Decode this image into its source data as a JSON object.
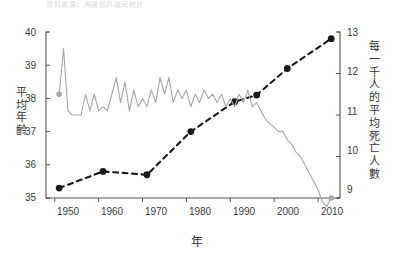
{
  "figure": {
    "caption_faint": "資料來源：內政部戶政司統計",
    "background": "#ffffff"
  },
  "axes": {
    "x": {
      "label": "年",
      "ticks": [
        "1950",
        "1960",
        "1970",
        "1980",
        "1990",
        "2000",
        "2010"
      ],
      "range": [
        1948,
        2015
      ]
    },
    "y_left": {
      "label_chars": [
        "平",
        "均",
        "年",
        "齡"
      ],
      "label": "平均年齡",
      "ticks": [
        "35",
        "36",
        "37",
        "38",
        "39",
        "40"
      ],
      "range": [
        35,
        40
      ],
      "color": "#222222"
    },
    "y_right": {
      "label_chars": [
        "每",
        "一",
        "千",
        "人",
        "的",
        "平",
        "均",
        "死",
        "亡",
        "人",
        "數"
      ],
      "label": "每一千人的平均死亡人數",
      "ticks": [
        "9",
        "10",
        "11",
        "12",
        "13"
      ],
      "range": [
        9,
        13
      ],
      "color": "#9a9a9a"
    }
  },
  "chart_data": {
    "type": "line",
    "title": "",
    "subtitle": "",
    "xlabel": "年",
    "ylabel": "平均年齡",
    "ylabel_secondary": "每一千人的平均死亡人數",
    "xlim": [
      1948,
      2015
    ],
    "ylim": [
      35,
      40
    ],
    "ylim_secondary": [
      9,
      13
    ],
    "grid": false,
    "legend": "none",
    "series": [
      {
        "name": "平均年齡",
        "axis": "left",
        "style": "dashed",
        "marker": "circle",
        "color": "#1a1a1a",
        "x": [
          1951,
          1961,
          1971,
          1981,
          1991,
          1996,
          2003,
          2013
        ],
        "values": [
          35.3,
          35.8,
          35.7,
          37.0,
          37.9,
          38.1,
          38.9,
          39.8
        ]
      },
      {
        "name": "每一千人的平均死亡人數",
        "axis": "right",
        "style": "solid",
        "marker": "endpoints",
        "color": "#a6a6a6",
        "x": [
          1951,
          1952,
          1953,
          1954,
          1955,
          1956,
          1957,
          1958,
          1959,
          1960,
          1961,
          1962,
          1963,
          1964,
          1965,
          1966,
          1967,
          1968,
          1969,
          1970,
          1971,
          1972,
          1973,
          1974,
          1975,
          1976,
          1977,
          1978,
          1979,
          1980,
          1981,
          1982,
          1983,
          1984,
          1985,
          1986,
          1987,
          1988,
          1989,
          1990,
          1991,
          1992,
          1993,
          1994,
          1995,
          1996,
          1997,
          1998,
          1999,
          2000,
          2001,
          2002,
          2003,
          2004,
          2005,
          2006,
          2007,
          2008,
          2009,
          2010,
          2011,
          2012,
          2013
        ],
        "values": [
          11.5,
          12.6,
          11.1,
          11.0,
          11.0,
          11.0,
          11.5,
          11.1,
          11.5,
          11.1,
          11.2,
          11.1,
          11.5,
          11.9,
          11.3,
          11.8,
          11.1,
          11.6,
          11.2,
          11.4,
          11.2,
          11.6,
          11.3,
          11.9,
          11.5,
          11.9,
          11.3,
          11.6,
          11.4,
          11.6,
          11.2,
          11.5,
          11.3,
          11.6,
          11.4,
          11.5,
          11.3,
          11.5,
          11.2,
          11.4,
          11.2,
          11.5,
          11.3,
          11.6,
          11.2,
          11.3,
          11.1,
          10.9,
          10.8,
          10.7,
          10.6,
          10.6,
          10.4,
          10.3,
          10.1,
          10.0,
          9.8,
          9.6,
          9.4,
          9.2,
          8.9,
          8.8,
          9.0
        ]
      }
    ]
  }
}
